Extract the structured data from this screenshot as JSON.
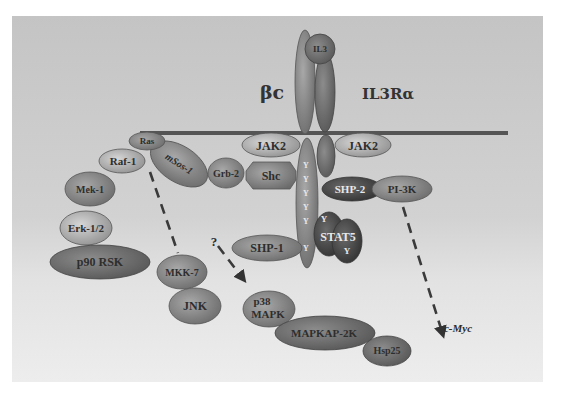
{
  "diagram": {
    "colors": {
      "panel_top": "#c4c4c4",
      "panel_bottom": "#ededed",
      "membrane": "#555555",
      "beta_c": "#8a8a8a",
      "il3ra": "#5e5e5e",
      "dark_node": "#3c3c3c",
      "mid_node": "#7a7a7a",
      "light_node": "#b4b4b4"
    },
    "labels": {
      "beta_c": "βc",
      "il3ra": "IL3Rα",
      "il3": "IL3",
      "question": "?",
      "c_myc": "c-Myc"
    },
    "nodes": {
      "ras": "Ras",
      "raf1": "Raf-1",
      "msos1": "mSos-1",
      "grb2": "Grb-2",
      "shc": "Shc",
      "jak2_left": "JAK2",
      "jak2_right": "JAK2",
      "mek1": "Mek-1",
      "erk12": "Erk-1/2",
      "p90rsk": "p90 RSK",
      "shp2": "SHP-2",
      "pi3k": "PI-3K",
      "stat5": "STAT5",
      "stat5_y1": "Y",
      "stat5_y2": "Y",
      "shp1": "SHP-1",
      "mkk7": "MKK-7",
      "jnk": "JNK",
      "p38_line1": "p38",
      "p38_line2": "MAPK",
      "mapkap2k": "MAPKAP-2K",
      "hsp25": "Hsp25"
    },
    "phosphotyrosines": [
      "Y",
      "Y",
      "Y",
      "Y",
      "Y",
      "Y"
    ],
    "edges": [
      {
        "from": "Ras",
        "to": "MKK-7",
        "style": "dashed"
      },
      {
        "from": "?",
        "to": "p38 MAPK",
        "style": "dashed-arrow"
      },
      {
        "from": "PI-3K",
        "to": "c-Myc",
        "style": "dashed-arrow"
      }
    ]
  }
}
